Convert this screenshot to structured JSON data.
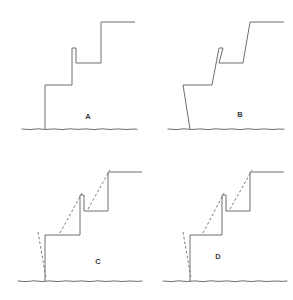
{
  "figure": {
    "type": "line-diagram-grid",
    "background_color": "#ffffff",
    "stroke_color": "#6e6e6e",
    "dashed_stroke_color": "#7a7a7a",
    "ground_color": "#5f5f5f",
    "label_color": "#3a3a3a",
    "rows": 2,
    "columns": 2
  },
  "panels": [
    {
      "id": "A",
      "label": "A",
      "label_x": 88,
      "label_y": 119,
      "has_dashed_overlay": false,
      "riser_style": "vertical",
      "outline_points": "45,129 45,85 72,85 72,48 76,48 76,63 101,63 101,22 135,22",
      "ground_points": "22,129 30,129.6 38,128.8 46,129.5 54,128.9 62,129.6 70,128.8 78,129.4 86,128.9 94,129.6 102,128.8 110,129.5 118,128.9 126,129.5 134,129 137,129.3"
    },
    {
      "id": "B",
      "label": "B",
      "label_x": 240,
      "label_y": 117,
      "has_dashed_overlay": false,
      "riser_style": "slanted",
      "outline_points": "190,129 183,85 212,85 219,48 223,48 219,63 243,63 250,22 284,22",
      "ground_points": "168,129 176,129.6 184,128.8 192,129.5 200,128.9 208,129.6 216,128.8 224,129.4 232,128.9 240,129.6 248,128.8 256,129.5 264,128.9 272,129.5 280,129 284,129.3"
    },
    {
      "id": "C",
      "label": "C",
      "label_x": 98,
      "label_y": 264,
      "has_dashed_overlay": true,
      "riser_style": "vertical-with-peak",
      "outline_points": "45,281 45,235 80,235 80,195 84,195 84,211 108,211 108,172 142,172",
      "dashed_segments": [
        "38,232 46,278",
        "60,233 82,193",
        "88,209 110,170"
      ],
      "ground_points": "18,281 26,281.6 34,280.8 42,281.5 50,280.9 58,281.6 66,280.8 74,281.4 82,280.9 90,281.6 98,280.8 106,281.5 114,280.9 122,281.5 130,281 138,281.4 142,281"
    },
    {
      "id": "D",
      "label": "D",
      "label_x": 218,
      "label_y": 259,
      "has_dashed_overlay": true,
      "riser_style": "vertical-with-peak",
      "outline_points": "190,281 190,235 222,235 222,195 226,195 226,211 250,211 250,172 284,172",
      "dashed_segments": [
        "183,232 191,278",
        "203,233 224,193",
        "230,209 252,170"
      ],
      "ground_points": "163,281 171,281.6 179,280.8 187,281.5 195,280.9 203,281.6 211,280.8 219,281.4 227,280.9 235,281.6 243,280.8 251,281.5 259,280.9 267,281.5 275,281 283,281.4 287,281"
    }
  ]
}
